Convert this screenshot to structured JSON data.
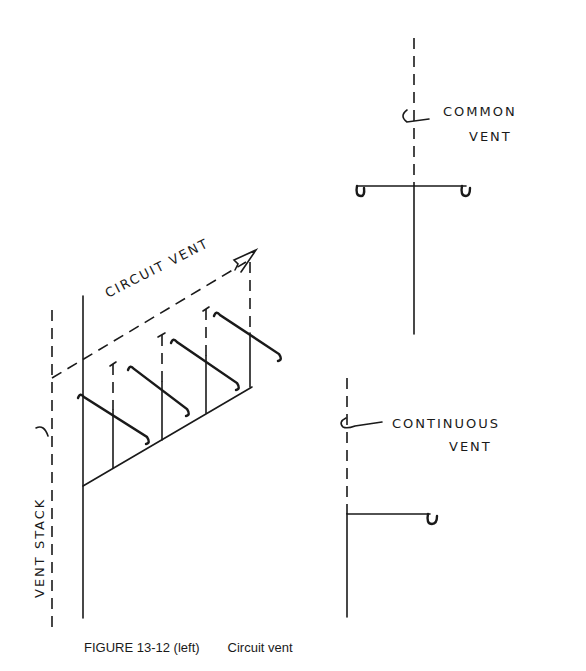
{
  "figure": {
    "number_label": "FIGURE 13-12 (left)",
    "title": "Circuit vent"
  },
  "left_diagram": {
    "circuit_vent_label": "CIRCUIT VENT",
    "vent_stack_label": "VENT STACK",
    "fixture_branches": 4
  },
  "right_diagrams": {
    "common_vent": {
      "line1": "COMMON",
      "line2": "VENT"
    },
    "continuous_vent": {
      "line1": "CONTINUOUS",
      "line2": "VENT"
    }
  }
}
